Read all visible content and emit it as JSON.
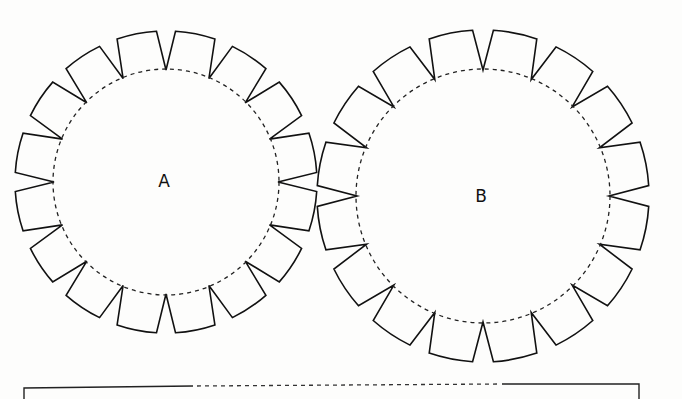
{
  "diagram": {
    "type": "paper cut-out template",
    "pieces": [
      {
        "id": "A",
        "label": "A",
        "tab_count": 16,
        "fold_line": "dashed circle"
      },
      {
        "id": "B",
        "label": "B",
        "tab_count": 16,
        "fold_line": "dashed circle"
      }
    ],
    "strip": {
      "description": "rectangular strip with dashed fold segment along top edge (partially visible)"
    },
    "colors": {
      "line": "#111111",
      "paper": "#fdfdfc"
    }
  }
}
